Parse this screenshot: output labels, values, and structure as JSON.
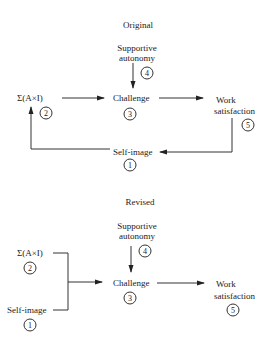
{
  "original": {
    "title": "Original",
    "nodes": {
      "supportive_autonomy": {
        "line1": "Supportive",
        "line2": "autonomy",
        "number": "4"
      },
      "sum_ai": {
        "label": "Σ(A×I)",
        "number": "2"
      },
      "challenge": {
        "label": "Challenge",
        "number": "3"
      },
      "work_satisfaction": {
        "line1": "Work",
        "line2": "satisfaction",
        "number": "5"
      },
      "self_image": {
        "label": "Self-image",
        "number": "1"
      }
    }
  },
  "revised": {
    "title": "Revised",
    "nodes": {
      "supportive_autonomy": {
        "line1": "Supportive",
        "line2": "autonomy",
        "number": "4"
      },
      "sum_ai": {
        "label": "Σ(A×I)",
        "number": "2"
      },
      "challenge": {
        "label": "Challenge",
        "number": "3"
      },
      "work_satisfaction": {
        "line1": "Work",
        "line2": "satisfaction",
        "number": "5"
      },
      "self_image": {
        "label": "Self-image",
        "number": "1"
      }
    }
  }
}
